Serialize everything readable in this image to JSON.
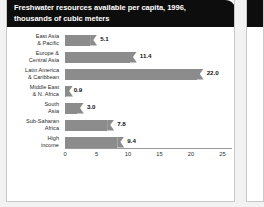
{
  "header": {
    "title_line1": "Freshwater resources available per capita, 1996,",
    "title_line2": "thousands of cubic meters"
  },
  "colors": {
    "header_bg": "#0d0d0d",
    "header_text": "#ffffff",
    "bar": "#8c8c8c",
    "page_bg": "#ffffff",
    "border": "#c9c9c9",
    "axis": "#9a9a9a"
  },
  "chart_data": {
    "type": "bar",
    "orientation": "horizontal",
    "title": "Freshwater resources available per capita, 1996, thousands of cubic meters",
    "xlabel": "",
    "ylabel": "",
    "xlim": [
      0,
      26.5
    ],
    "grid": false,
    "legend": null,
    "xticks": [
      "0",
      "5",
      "10",
      "15",
      "20",
      "25"
    ],
    "xtick_values": [
      0,
      5,
      10,
      15,
      20,
      25
    ],
    "categories": [
      "East Asia & Pacific",
      "Europe & Central Asia",
      "Latin America & Caribbean",
      "Middle East & N. Africa",
      "South Asia",
      "Sub-Saharan Africa",
      "High income"
    ],
    "category_lines": [
      [
        "East Asia",
        "& Pacific"
      ],
      [
        "Europe &",
        "Central Asia"
      ],
      [
        "Latin America",
        "& Caribbean"
      ],
      [
        "Middle East",
        "& N. Africa"
      ],
      [
        "South",
        "Asia"
      ],
      [
        "Sub-Saharan",
        "Africa"
      ],
      [
        "High",
        "income"
      ]
    ],
    "values": [
      5.1,
      11.4,
      22.0,
      0.9,
      3.0,
      7.8,
      9.4
    ],
    "value_labels": [
      "5.1",
      "11.4",
      "22.0",
      "0.9",
      "3.0",
      "7.8",
      "9.4"
    ]
  }
}
